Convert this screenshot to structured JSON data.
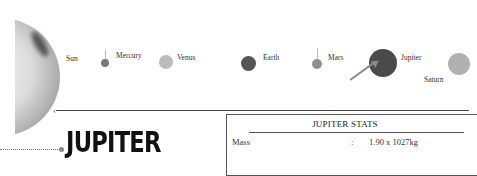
{
  "solar_system": {
    "planets": [
      {
        "name": "Sun",
        "color": "#d9d9d9"
      },
      {
        "name": "Mercury",
        "color": "#7a7a7a"
      },
      {
        "name": "Venus",
        "color": "#b5b5b5"
      },
      {
        "name": "Earth",
        "color": "#555555"
      },
      {
        "name": "Mars",
        "color": "#8f8f8f"
      },
      {
        "name": "Jupiter",
        "color": "#4a4a4a"
      },
      {
        "name": "Saturn",
        "color": "#b0b0b0"
      }
    ],
    "highlighted": "Jupiter"
  },
  "heading": {
    "title": "JUPITER"
  },
  "stats": {
    "title": "JUPITER STATS",
    "rows": [
      {
        "label": "Mass",
        "separator": ":",
        "value": "1.90 x 1027kg"
      }
    ]
  }
}
